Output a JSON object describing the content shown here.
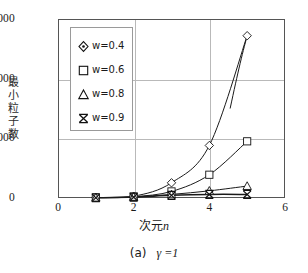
{
  "chart_data": {
    "type": "line",
    "title": "",
    "caption": "(a)",
    "caption_param": "γ =1",
    "xlabel": "次元n",
    "xlabel_plain": "次元",
    "xlabel_italic": "n",
    "ylabel": "最小粒子数",
    "ylabel_chars": [
      "最",
      "小",
      "粒",
      "子",
      "数"
    ],
    "xlim": [
      0,
      6
    ],
    "ylim": [
      0,
      3000
    ],
    "xticks": [
      0,
      2,
      4,
      6
    ],
    "yticks": [
      0,
      1000,
      2000,
      3000
    ],
    "xtick_labels": [
      "0",
      "2",
      "4",
      "6"
    ],
    "ytick_labels": [
      "0",
      "1000",
      "2000",
      "3000"
    ],
    "grid": "both-inner",
    "gridlines_x": [
      2,
      4
    ],
    "gridlines_y": [
      1000,
      2000
    ],
    "legend_position": "upper-left-inset",
    "x": [
      1,
      2,
      3,
      4,
      5
    ],
    "series": [
      {
        "name": "w=0.4",
        "marker": "diamond",
        "values": [
          8,
          30,
          255,
          880,
          2720
        ]
      },
      {
        "name": "w=0.6",
        "marker": "square",
        "values": [
          6,
          22,
          110,
          390,
          950
        ]
      },
      {
        "name": "w=0.8",
        "marker": "triangle",
        "values": [
          5,
          18,
          60,
          120,
          200
        ]
      },
      {
        "name": "w=0.9",
        "marker": "cross",
        "values": [
          4,
          15,
          45,
          60,
          60
        ]
      }
    ]
  },
  "legend": {
    "items": [
      {
        "label": "w=0.4",
        "marker": "diamond-marker"
      },
      {
        "label": "w=0.6",
        "marker": "square-marker"
      },
      {
        "label": "w=0.8",
        "marker": "triangle-marker"
      },
      {
        "label": "w=0.9",
        "marker": "cross-marker"
      }
    ]
  },
  "axis": {
    "y_labels": [
      "3000",
      "2000",
      "1000",
      "0"
    ],
    "x_labels": [
      "0",
      "2",
      "4",
      "6"
    ]
  },
  "colors": {
    "frame": "#555555",
    "grid": "#b9b9b9",
    "series": "#1a1a1a",
    "background": "#ffffff"
  }
}
